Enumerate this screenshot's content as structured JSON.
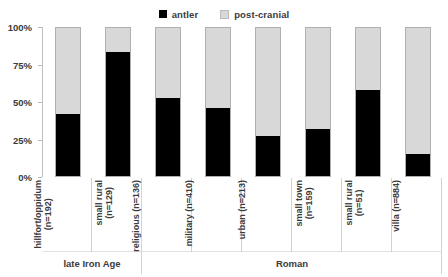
{
  "chart_data": {
    "type": "bar",
    "subtype": "stacked-100-percent",
    "title": "",
    "xlabel": "",
    "ylabel": "",
    "ylim": [
      0,
      100
    ],
    "ytick_labels": [
      "100%",
      "75%",
      "50%",
      "25%",
      "0%"
    ],
    "ytick_values": [
      100,
      75,
      50,
      25,
      0
    ],
    "grid": false,
    "legend_position": "top-center",
    "legend": [
      "antler",
      "post-cranial"
    ],
    "categories": [
      "hillfort/oppidum (n=192)",
      "small rural (n=129)",
      "religious (n=136)",
      "military (n=410)",
      "urban (n=213)",
      "small town (n=159)",
      "small rural (n=51)",
      "villa (n=884)"
    ],
    "category_lines": [
      [
        "hillfort/oppidum",
        "(n=192)"
      ],
      [
        "small rural",
        "(n=129)"
      ],
      [
        "religious (n=136)",
        ""
      ],
      [
        "military (n=410)",
        ""
      ],
      [
        "urban (n=213)",
        ""
      ],
      [
        "small town",
        "(n=159)"
      ],
      [
        "small rural",
        "(n=51)"
      ],
      [
        "villa (n=884)",
        ""
      ]
    ],
    "sample_sizes": [
      192,
      129,
      136,
      410,
      213,
      159,
      51,
      884
    ],
    "series": [
      {
        "name": "antler",
        "color": "#000000",
        "values": [
          42,
          84,
          53,
          46,
          27,
          32,
          58,
          15
        ]
      },
      {
        "name": "post-cranial",
        "color": "#d8d8d8",
        "values": [
          58,
          16,
          47,
          54,
          73,
          68,
          42,
          85
        ]
      }
    ],
    "groups": [
      {
        "label": "late Iron Age",
        "span": 2
      },
      {
        "label": "Roman",
        "span": 6
      }
    ]
  },
  "colors": {
    "antler": "#000000",
    "post_cranial": "#d8d8d8",
    "bar_outline": "#b0b0b0",
    "axis": "#bdbdbd",
    "text": "#3b3b3b",
    "background": "#ffffff"
  }
}
